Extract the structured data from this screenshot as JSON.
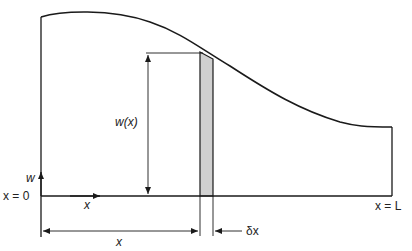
{
  "diagram": {
    "type": "beam load distribution",
    "labels": {
      "w_axis": "w",
      "w_of_x": "w(x)",
      "origin": "x = 0",
      "end": "x = L",
      "x_axis": "x",
      "x_distance": "x",
      "delta_x": "δx"
    },
    "colors": {
      "stroke": "#1a1a1a",
      "strip_fill": "#d0d0d0"
    }
  }
}
